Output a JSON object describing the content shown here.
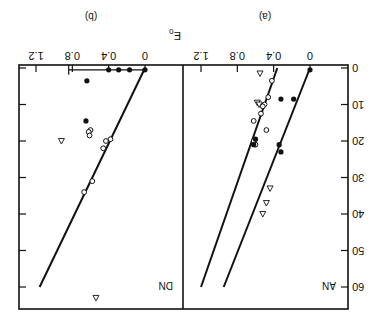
{
  "chart_data": [
    {
      "type": "scatter",
      "panel_label": "(a)",
      "inset_label": "AN",
      "xlabel": "E₀",
      "ylabel": "",
      "x_ticks": [
        "0",
        "0.4",
        "0.8",
        "1.2"
      ],
      "y_ticks": [
        "0",
        "10",
        "20",
        "30",
        "40",
        "50",
        "60"
      ],
      "xlim": [
        0,
        1.2
      ],
      "ylim": [
        0,
        60
      ],
      "orientation": "figure rotated 180 degrees",
      "series": [
        {
          "name": "filled circles",
          "marker": "filled-circle",
          "points": [
            [
              0.0,
              0.5
            ],
            [
              0.18,
              8.5
            ],
            [
              0.32,
              8.5
            ],
            [
              0.34,
              21
            ],
            [
              0.32,
              23
            ]
          ]
        },
        {
          "name": "open circles",
          "marker": "open-circle",
          "points": [
            [
              0.42,
              3.5
            ],
            [
              0.46,
              8
            ],
            [
              0.5,
              10
            ],
            [
              0.52,
              10.5
            ],
            [
              0.54,
              12.5
            ],
            [
              0.62,
              14.5
            ],
            [
              0.48,
              17
            ],
            [
              0.6,
              21
            ],
            [
              0.62,
              20
            ]
          ]
        },
        {
          "name": "open triangles",
          "marker": "open-triangle",
          "points": [
            [
              0.55,
              1.5
            ],
            [
              0.58,
              9.5
            ],
            [
              0.56,
              10
            ],
            [
              0.44,
              33
            ],
            [
              0.48,
              37
            ],
            [
              0.52,
              40
            ]
          ]
        },
        {
          "name": "filled circle cluster",
          "marker": "filled-circle",
          "points": [
            [
              0.6,
              19.5
            ],
            [
              0.62,
              21
            ]
          ]
        }
      ],
      "fit_lines": [
        {
          "name": "line 1",
          "from": [
            0.0,
            0
          ],
          "to": [
            0.95,
            60
          ]
        },
        {
          "name": "line 2",
          "from": [
            0.36,
            0
          ],
          "to": [
            1.2,
            60
          ]
        }
      ]
    },
    {
      "type": "scatter",
      "panel_label": "(b)",
      "inset_label": "DN",
      "xlabel": "E₀",
      "x_ticks": [
        "0",
        "0.4",
        "0.8",
        "1.2"
      ],
      "y_ticks": [
        "0",
        "10",
        "20",
        "30",
        "40",
        "50",
        "60"
      ],
      "xlim": [
        0,
        1.2
      ],
      "ylim": [
        0,
        60
      ],
      "series": [
        {
          "name": "filled circles",
          "marker": "filled-circle",
          "points": [
            [
              0.0,
              0.5
            ],
            [
              0.17,
              0.5
            ],
            [
              0.29,
              0.5
            ],
            [
              0.4,
              0.5
            ],
            [
              0.64,
              3.5
            ],
            [
              0.65,
              14.5
            ]
          ]
        },
        {
          "name": "open circles",
          "marker": "open-circle",
          "points": [
            [
              0.6,
              17
            ],
            [
              0.62,
              17.5
            ],
            [
              0.61,
              18.5
            ],
            [
              0.38,
              19.5
            ],
            [
              0.43,
              20
            ],
            [
              0.46,
              22
            ],
            [
              0.58,
              31
            ],
            [
              0.67,
              34
            ]
          ]
        },
        {
          "name": "open triangles",
          "marker": "open-triangle",
          "points": [
            [
              0.92,
              20
            ],
            [
              0.54,
              63
            ]
          ]
        }
      ],
      "error_bar": {
        "y": 0.5,
        "from": 0.0,
        "to": 0.84
      },
      "fit_lines": [
        {
          "name": "line",
          "from": [
            0.0,
            0
          ],
          "to": [
            1.16,
            60
          ]
        }
      ]
    }
  ],
  "labels": {
    "axis_title": "E",
    "axis_title_sub": "0",
    "panel_a": "(a)",
    "panel_b": "(b)",
    "inset_a": "AN",
    "inset_b": "DN",
    "x_ticks": [
      "0",
      "0.4",
      "0.8",
      "1.2"
    ],
    "y_ticks": [
      "0",
      "10",
      "20",
      "30",
      "40",
      "50",
      "60"
    ]
  }
}
